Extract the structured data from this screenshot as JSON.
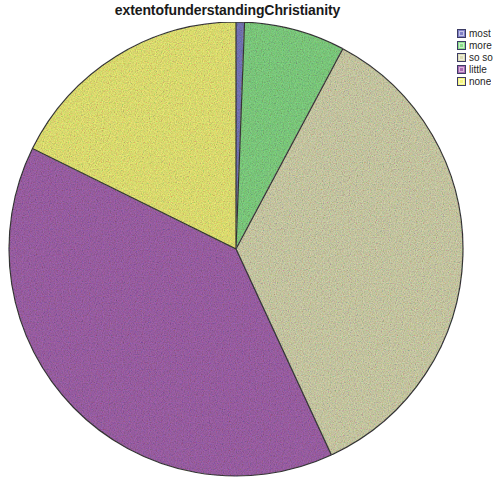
{
  "chart_data": {
    "type": "pie",
    "title": "extentofunderstandingChristianity",
    "categories": [
      "most",
      "more",
      "so so",
      "little",
      "none"
    ],
    "values": [
      0.6,
      7.2,
      35.3,
      39.2,
      17.7
    ],
    "colors": [
      "#8080c8",
      "#8ade8a",
      "#dcdcb4",
      "#aa69b4",
      "#f5f57d"
    ],
    "legend_position": "right",
    "legend_labels": [
      "most",
      "more",
      "so so",
      "little",
      "none"
    ],
    "start_angle_deg": 0,
    "direction": "clockwise",
    "grid": false,
    "xlabel": "",
    "ylabel": "",
    "slice_labels_shown": false,
    "outline_color": "#3c3c3c",
    "geometry": {
      "center_x": 236,
      "center_y": 249,
      "radius": 227
    }
  },
  "legend": {
    "items": [
      {
        "label": "most",
        "color": "#8080c8"
      },
      {
        "label": "more",
        "color": "#8ade8a"
      },
      {
        "label": "so so",
        "color": "#dcdcb4"
      },
      {
        "label": "little",
        "color": "#aa69b4"
      },
      {
        "label": "none",
        "color": "#f5f57d"
      }
    ]
  }
}
